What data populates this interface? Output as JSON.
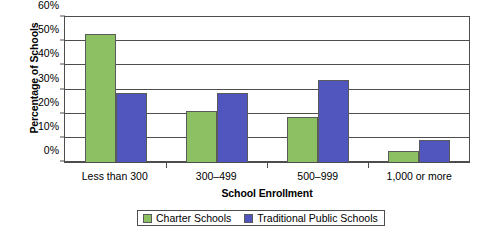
{
  "chart_data": {
    "type": "bar",
    "title": "",
    "subtitle": "",
    "xlabel": "School Enrollment",
    "ylabel": "Percentage of Schools",
    "categories": [
      "Less than 300",
      "300–499",
      "500–999",
      "1,000 or more"
    ],
    "series": [
      {
        "name": "Charter Schools",
        "color": "#8cc063",
        "values": [
          53,
          21,
          18.5,
          4.5
        ]
      },
      {
        "name": "Traditional Public Schools",
        "color": "#5155be",
        "values": [
          28.5,
          28.5,
          34,
          9
        ]
      }
    ],
    "ylim": [
      0,
      60
    ],
    "ytick_labels": [
      "0%",
      "10%",
      "20%",
      "30%",
      "40%",
      "50%",
      "60%"
    ],
    "ytick_values": [
      0,
      10,
      20,
      30,
      40,
      50,
      60
    ],
    "grid": true,
    "legend_position": "bottom",
    "value_suffix": "%"
  },
  "axes": {
    "y_title": "Percentage of Schools",
    "x_title": "School Enrollment"
  },
  "legend": {
    "entries": [
      {
        "label": "Charter Schools",
        "color": "#8cc063"
      },
      {
        "label": "Traditional Public Schools",
        "color": "#5155be"
      }
    ]
  },
  "colors": {
    "series_charter": "#8cc063",
    "series_traditional": "#5155be",
    "axis": "#4d4d4d",
    "background": "#ffffff"
  }
}
